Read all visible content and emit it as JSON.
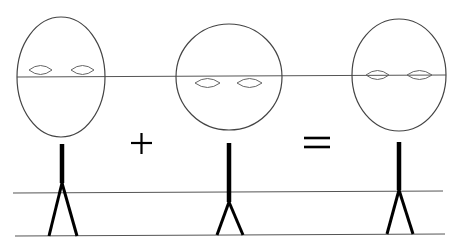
{
  "diagram": {
    "operators": {
      "plus": "+",
      "equals": "="
    },
    "figures": [
      {
        "id": "figure-1",
        "head_shape": "tall oval",
        "eyes": "above center line"
      },
      {
        "id": "figure-2",
        "head_shape": "circle",
        "eyes": "below center line"
      },
      {
        "id": "figure-3",
        "head_shape": "oval",
        "eyes": "on center line"
      }
    ],
    "guide_lines": [
      "eye-level line",
      "hip-level line",
      "ground line"
    ],
    "colors": {
      "line": "#555555",
      "figure": "#000000",
      "background": "#ffffff"
    }
  }
}
